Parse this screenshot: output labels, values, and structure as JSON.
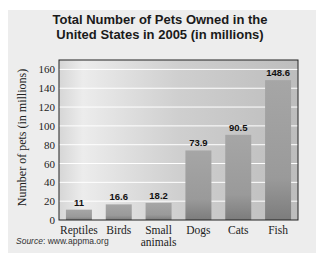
{
  "chart_data": {
    "type": "bar",
    "title": "Total Number of Pets Owned in the United States in 2005 (in millions)",
    "title_lines": [
      "Total Number of Pets Owned in the",
      "United States in 2005 (in millions)"
    ],
    "categories": [
      "Reptiles",
      "Birds",
      "Small animals",
      "Dogs",
      "Cats",
      "Fish"
    ],
    "category_lines": [
      [
        "Reptiles"
      ],
      [
        "Birds"
      ],
      [
        "Small",
        "animals"
      ],
      [
        "Dogs"
      ],
      [
        "Cats"
      ],
      [
        "Fish"
      ]
    ],
    "values": [
      11,
      16.6,
      18.2,
      73.9,
      90.5,
      148.6
    ],
    "data_labels": [
      "11",
      "16.6",
      "18.2",
      "73.9",
      "90.5",
      "148.6"
    ],
    "xlabel": "",
    "ylabel": "Number of pets (in millions)",
    "ylim": [
      0,
      170
    ],
    "yticks": [
      0,
      20,
      40,
      60,
      80,
      100,
      120,
      140,
      160
    ],
    "grid": true,
    "colors": {
      "bar": "#a0a0a0",
      "bar_base": "#7a7a7a",
      "grid": "#ffffff",
      "plot_bg": "#c8c8c8"
    }
  },
  "source": {
    "label": "Source",
    "text": ": www.appma.org"
  }
}
